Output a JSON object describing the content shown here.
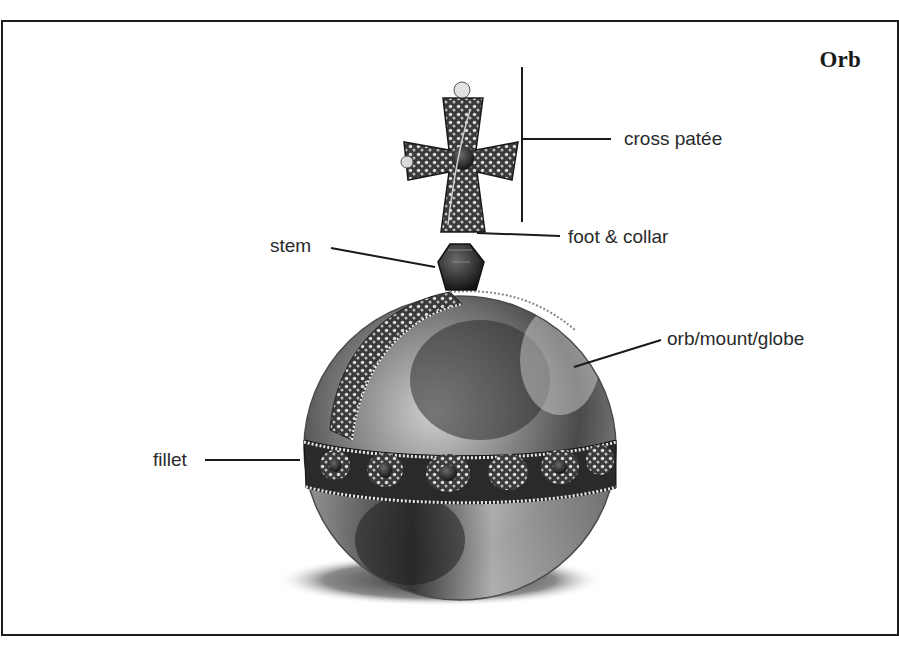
{
  "diagram": {
    "title": "Orb",
    "labels": [
      {
        "id": "cross-patee",
        "text": "cross patée"
      },
      {
        "id": "foot-collar",
        "text": "foot & collar"
      },
      {
        "id": "stem",
        "text": "stem"
      },
      {
        "id": "orb-mount-globe",
        "text": "orb/mount/globe"
      },
      {
        "id": "fillet",
        "text": "fillet"
      }
    ]
  },
  "colors": {
    "border": "#1c1c1c",
    "leader_line": "#1a1a1a",
    "label_text": "#2a2a2a",
    "background": "#ffffff"
  }
}
